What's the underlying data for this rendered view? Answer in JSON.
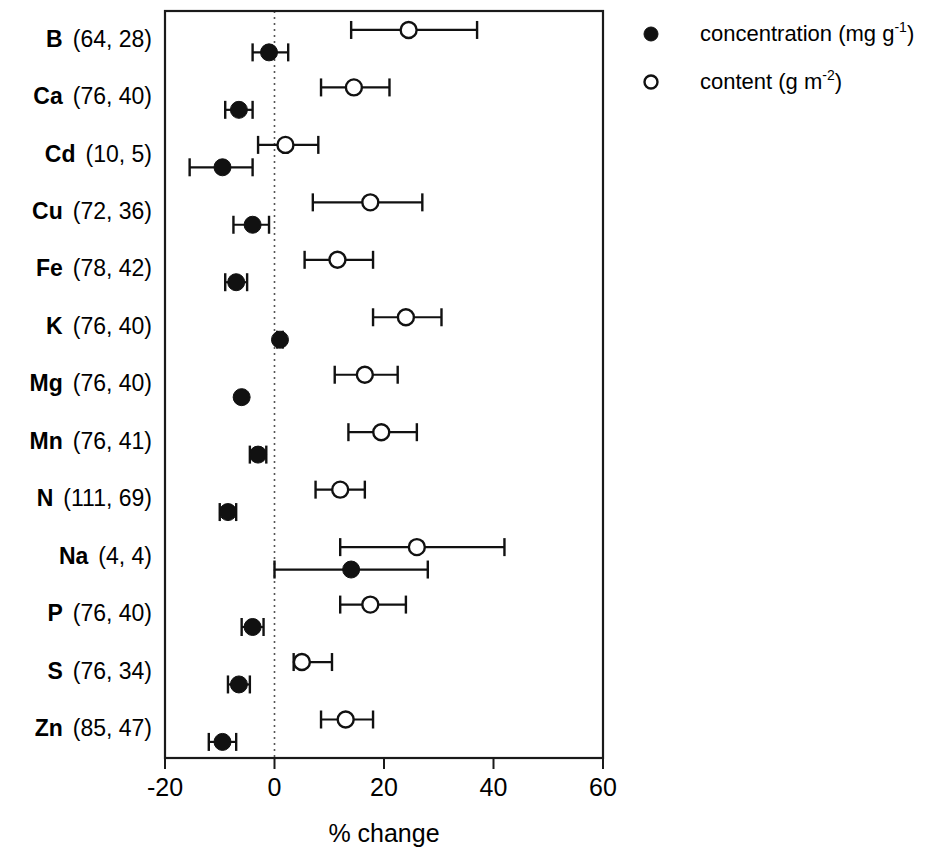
{
  "chart_data": {
    "type": "scatter",
    "title": "",
    "xlabel": "% change",
    "ylabel": "",
    "xlim": [
      -20,
      60
    ],
    "xticks": [
      -20,
      0,
      20,
      40,
      60
    ],
    "xtick_labels": [
      "-20",
      "0",
      "20",
      "40",
      "60"
    ],
    "grid": false,
    "reference_line": 0,
    "orientation": "horizontal",
    "legend_position": "top-right",
    "legend": [
      {
        "marker": "filled-circle",
        "label": "concentration (mg g",
        "sup": "-1",
        "tail": ")"
      },
      {
        "marker": "open-circle",
        "label": "content (g m",
        "sup": "-2",
        "tail": ")"
      }
    ],
    "categories": [
      {
        "symbol": "B",
        "n": "(64, 28)"
      },
      {
        "symbol": "Ca",
        "n": "(76, 40)"
      },
      {
        "symbol": "Cd",
        "n": "(10, 5)"
      },
      {
        "symbol": "Cu",
        "n": "(72, 36)"
      },
      {
        "symbol": "Fe",
        "n": "(78, 42)"
      },
      {
        "symbol": "K",
        "n": "(76, 40)"
      },
      {
        "symbol": "Mg",
        "n": "(76, 40)"
      },
      {
        "symbol": "Mn",
        "n": "(76, 41)"
      },
      {
        "symbol": "N",
        "n": "(111, 69)"
      },
      {
        "symbol": "Na",
        "n": "(4, 4)"
      },
      {
        "symbol": "P",
        "n": "(76, 40)"
      },
      {
        "symbol": "S",
        "n": "(76, 34)"
      },
      {
        "symbol": "Zn",
        "n": "(85, 47)"
      }
    ],
    "series": [
      {
        "name": "content (g m-2)",
        "marker": "open-circle",
        "values": [
          24.5,
          14.5,
          2.0,
          17.5,
          11.5,
          24.0,
          16.5,
          19.5,
          12.0,
          26.0,
          17.5,
          5.0,
          13.0
        ],
        "ci_low": [
          14.0,
          8.5,
          -3.0,
          7.0,
          5.5,
          18.0,
          11.0,
          13.5,
          7.5,
          12.0,
          12.0,
          3.5,
          8.5
        ],
        "ci_high": [
          37.0,
          21.0,
          8.0,
          27.0,
          18.0,
          30.5,
          22.5,
          26.0,
          16.5,
          42.0,
          24.0,
          10.5,
          18.0
        ]
      },
      {
        "name": "concentration (mg g-1)",
        "marker": "filled-circle",
        "values": [
          -1.0,
          -6.5,
          -9.5,
          -4.0,
          -7.0,
          1.0,
          -6.0,
          -3.0,
          -8.5,
          14.0,
          -4.0,
          -6.5,
          -9.5
        ],
        "ci_low": [
          -4.0,
          -9.0,
          -15.5,
          -7.5,
          -9.0,
          0.5,
          -6.0,
          -4.5,
          -10.0,
          0.0,
          -6.0,
          -8.5,
          -12.0
        ],
        "ci_high": [
          2.5,
          -4.0,
          -4.0,
          -1.0,
          -5.0,
          1.5,
          -6.0,
          -1.5,
          -7.0,
          28.0,
          -2.0,
          -4.5,
          -7.0
        ]
      }
    ]
  }
}
